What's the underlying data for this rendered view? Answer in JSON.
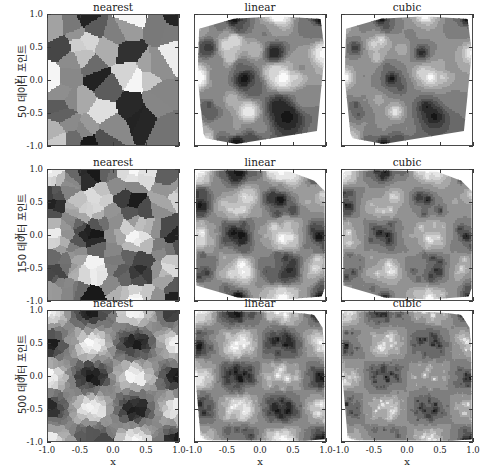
{
  "figure": {
    "title": "",
    "columns": [
      "nearest",
      "linear",
      "cubic"
    ],
    "rows": [
      {
        "label": "50 데이터 포인트",
        "n_points": 50
      },
      {
        "label": "150 데이터 포인트",
        "n_points": 150
      },
      {
        "label": "500 데이터 포인트",
        "n_points": 500
      }
    ],
    "axis": {
      "xlabel": "x",
      "ylabel": "y",
      "xticks": [
        "-1.0",
        "-0.5",
        "0.0",
        "0.5",
        "1.0"
      ],
      "yticks": [
        "1.0",
        "0.5",
        "0.0",
        "-0.5",
        "-1.0"
      ],
      "xtick_values": [
        -1.0,
        -0.5,
        0.0,
        0.5,
        1.0
      ],
      "ytick_values": [
        1.0,
        0.5,
        0.0,
        -0.5,
        -1.0
      ],
      "xlim": [
        -1.0,
        1.0
      ],
      "ylim": [
        -1.0,
        1.0
      ]
    },
    "colors": {
      "axis_line": "#4a4a4a",
      "text": "#1c1c1c",
      "background": "#ffffff",
      "cmap_low": "#1a1a1a",
      "cmap_high": "#ffffff"
    }
  },
  "chart_data": {
    "type": "heatmap",
    "title": "",
    "xlabel": "x",
    "ylabel": "y",
    "xlim": [
      -1.0,
      1.0
    ],
    "ylim": [
      -1.0,
      1.0
    ],
    "grid": false,
    "legend": null,
    "colormap": "gray",
    "panel_grid": {
      "rows": 3,
      "cols": 3
    },
    "row_labels": [
      "50 데이터 포인트",
      "150 데이터 포인트",
      "500 데이터 포인트"
    ],
    "col_labels": [
      "nearest",
      "linear",
      "cubic"
    ],
    "underlying_function": "f(x,y) = sin(3*pi*x/2) * cos(2*pi*y)",
    "field_lobes": {
      "x_periods": 3,
      "y_periods": 4
    },
    "value_range": [
      -1.0,
      1.0
    ],
    "panels": [
      {
        "row": 0,
        "col": 0,
        "method": "nearest",
        "n_points": 50,
        "description": "Voronoi cells of 50 scattered samples, hard-edged piecewise-constant grayscale regions filling the full square.",
        "fills_square": true,
        "cell_count": 50
      },
      {
        "row": 0,
        "col": 1,
        "method": "linear",
        "n_points": 50,
        "description": "Delaunay linear interpolation inside convex hull of 50 points; white outside hull; faceted contour bands.",
        "fills_square": false,
        "cell_count": 50
      },
      {
        "row": 0,
        "col": 2,
        "method": "cubic",
        "n_points": 50,
        "description": "Clough-Tocher cubic interpolation inside convex hull of 50 points; smooth rounded lobes; white outside hull.",
        "fills_square": false,
        "cell_count": 50
      },
      {
        "row": 1,
        "col": 0,
        "method": "nearest",
        "n_points": 150,
        "description": "Voronoi cells of 150 samples; smaller cells, lobe structure beginning to emerge.",
        "fills_square": true,
        "cell_count": 150
      },
      {
        "row": 1,
        "col": 1,
        "method": "linear",
        "n_points": 150,
        "description": "Linear interpolation over 150 points; 3x4 blob grid visible with slightly angular contours.",
        "fills_square": false,
        "cell_count": 150
      },
      {
        "row": 1,
        "col": 2,
        "method": "cubic",
        "n_points": 150,
        "description": "Cubic interpolation over 150 points; smooth 3x4 grid of dark/light lobes.",
        "fills_square": false,
        "cell_count": 150
      },
      {
        "row": 2,
        "col": 0,
        "method": "nearest",
        "n_points": 500,
        "description": "Voronoi cells of 500 samples; fine mosaic closely approximating the 3x4 lobe field.",
        "fills_square": true,
        "cell_count": 500
      },
      {
        "row": 2,
        "col": 1,
        "method": "linear",
        "n_points": 500,
        "description": "Linear interpolation over 500 points; crisp 3x4 lobe grid with banded contours.",
        "fills_square": false,
        "cell_count": 500
      },
      {
        "row": 2,
        "col": 2,
        "method": "cubic",
        "n_points": 500,
        "description": "Cubic interpolation over 500 points; smoothest 3x4 lobe grid, near-analytic appearance.",
        "fills_square": false,
        "cell_count": 500
      }
    ]
  }
}
